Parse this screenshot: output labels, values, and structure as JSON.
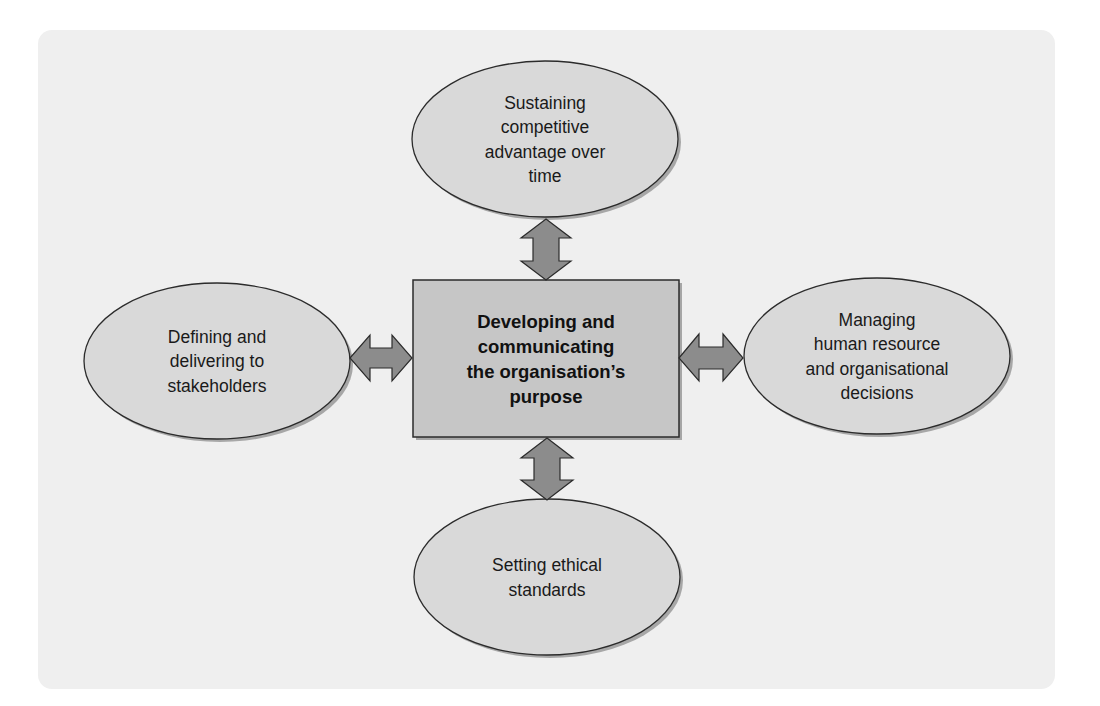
{
  "diagram": {
    "type": "hub-and-spoke",
    "colors": {
      "panel_background": "#efefef",
      "ellipse_fill": "#d9d9d9",
      "center_box_fill": "#c6c6c6",
      "arrow_fill": "#8c8c8c",
      "outline": "#2b2b2b",
      "shadow": "#9a9a9a",
      "text": "#1a1a1a"
    },
    "center": {
      "label": "Developing and\ncommunicating\nthe organisation’s\npurpose"
    },
    "nodes": {
      "top": {
        "label": "Sustaining\ncompetitive\nadvantage over\ntime"
      },
      "left": {
        "label": "Defining and\ndelivering to\nstakeholders"
      },
      "right": {
        "label": "Managing\nhuman resource\nand organisational\ndecisions"
      },
      "bottom": {
        "label": "Setting ethical\nstandards"
      }
    },
    "connectors": [
      {
        "from": "center",
        "to": "top",
        "style": "double-headed-arrow"
      },
      {
        "from": "center",
        "to": "left",
        "style": "double-headed-arrow"
      },
      {
        "from": "center",
        "to": "right",
        "style": "double-headed-arrow"
      },
      {
        "from": "center",
        "to": "bottom",
        "style": "double-headed-arrow"
      }
    ]
  }
}
